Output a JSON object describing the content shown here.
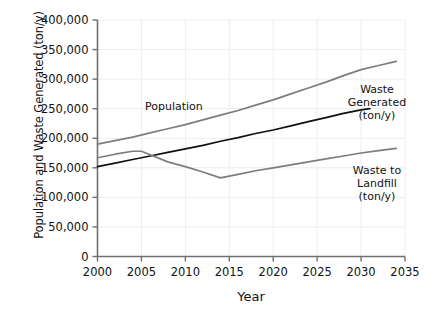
{
  "chart_data": {
    "type": "line",
    "title": "",
    "xlabel": "Year",
    "ylabel": "Population and Waste Generated (ton/y)",
    "xlim": [
      2000,
      2035
    ],
    "ylim": [
      0,
      400000
    ],
    "xticks": [
      "2000",
      "2005",
      "2010",
      "2015",
      "2020",
      "2025",
      "2030",
      "2035"
    ],
    "xtick_values": [
      2000,
      2005,
      2010,
      2015,
      2020,
      2025,
      2030,
      2035
    ],
    "yticks": [
      "0",
      "50,000",
      "100,000",
      "150,000",
      "200,000",
      "250,000",
      "300,000",
      "350,000",
      "400,000"
    ],
    "ytick_values": [
      0,
      50000,
      100000,
      150000,
      200000,
      250000,
      300000,
      350000,
      400000
    ],
    "grid": true,
    "legend_position": "inline-annotations",
    "series": [
      {
        "name": "Population",
        "label": "Population",
        "color": "#7d7d7d",
        "label_position": "above-line-left",
        "x": [
          2000,
          2002,
          2004,
          2006,
          2008,
          2010,
          2012,
          2014,
          2016,
          2018,
          2020,
          2022,
          2024,
          2026,
          2028,
          2030,
          2032,
          2034
        ],
        "values": [
          190000,
          196000,
          202000,
          209000,
          216000,
          223000,
          231000,
          239000,
          247000,
          256000,
          265000,
          275000,
          285000,
          295000,
          306000,
          316000,
          323000,
          330000
        ]
      },
      {
        "name": "Waste Generated (ton/y)",
        "label": "Waste\nGenerated\n(ton/y)",
        "label_lines": [
          "Waste",
          "Generated",
          "(ton/y)"
        ],
        "color": "#111111",
        "label_position": "right",
        "x": [
          2000,
          2002,
          2004,
          2006,
          2008,
          2010,
          2012,
          2014,
          2016,
          2018,
          2020,
          2022,
          2024,
          2026,
          2028,
          2030,
          2031
        ],
        "values": [
          152000,
          158000,
          164000,
          170000,
          176000,
          182000,
          188000,
          195000,
          201000,
          208000,
          214000,
          221000,
          228000,
          235000,
          242000,
          248000,
          250000
        ]
      },
      {
        "name": "Waste to Landfill (ton/y)",
        "label": "Waste to\nLandfill\n(ton/y)",
        "label_lines": [
          "Waste to",
          "Landfill",
          "(ton/y)"
        ],
        "color": "#7d7d7d",
        "label_position": "right",
        "x": [
          2000,
          2002,
          2004,
          2005,
          2006,
          2008,
          2010,
          2012,
          2014,
          2016,
          2018,
          2020,
          2022,
          2024,
          2026,
          2028,
          2030,
          2032,
          2034
        ],
        "values": [
          167000,
          173000,
          178000,
          178000,
          172000,
          160000,
          152000,
          143000,
          133000,
          139000,
          145000,
          150000,
          155000,
          160000,
          165000,
          170000,
          175000,
          179000,
          183000
        ]
      }
    ]
  },
  "annotations": {
    "population": "Population",
    "waste_generated_line1": "Waste",
    "waste_generated_line2": "Generated",
    "waste_generated_line3": "(ton/y)",
    "waste_landfill_line1": "Waste to",
    "waste_landfill_line2": "Landfill",
    "waste_landfill_line3": "(ton/y)"
  },
  "axes": {
    "x_title": "Year",
    "y_title": "Population and Waste Generated (ton/y)"
  }
}
